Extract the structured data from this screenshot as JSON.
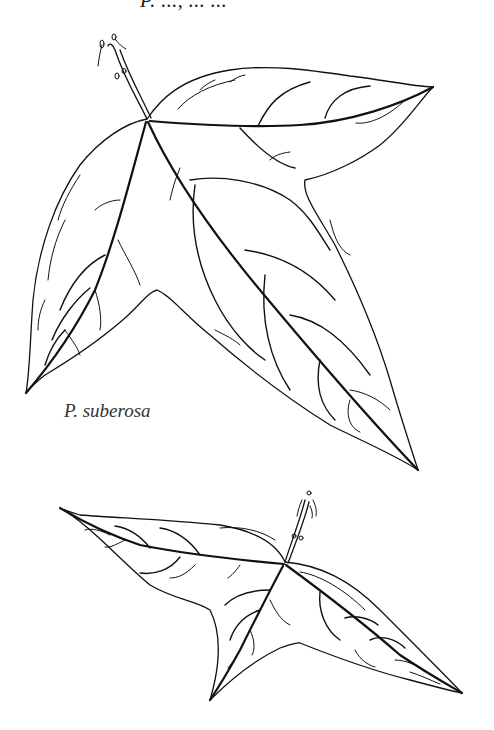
{
  "header": {
    "cropped_caption": "P. ..., ... ..."
  },
  "figure": {
    "type": "botanical line drawing",
    "colors": {
      "ink": "#111111",
      "background": "#ffffff"
    },
    "leaves": [
      {
        "id": "upper-leaf",
        "lobes": 3,
        "label": "P. suberosa"
      },
      {
        "id": "lower-leaf",
        "lobes": 3,
        "label": ""
      }
    ]
  },
  "labels": {
    "species": "P. suberosa"
  }
}
